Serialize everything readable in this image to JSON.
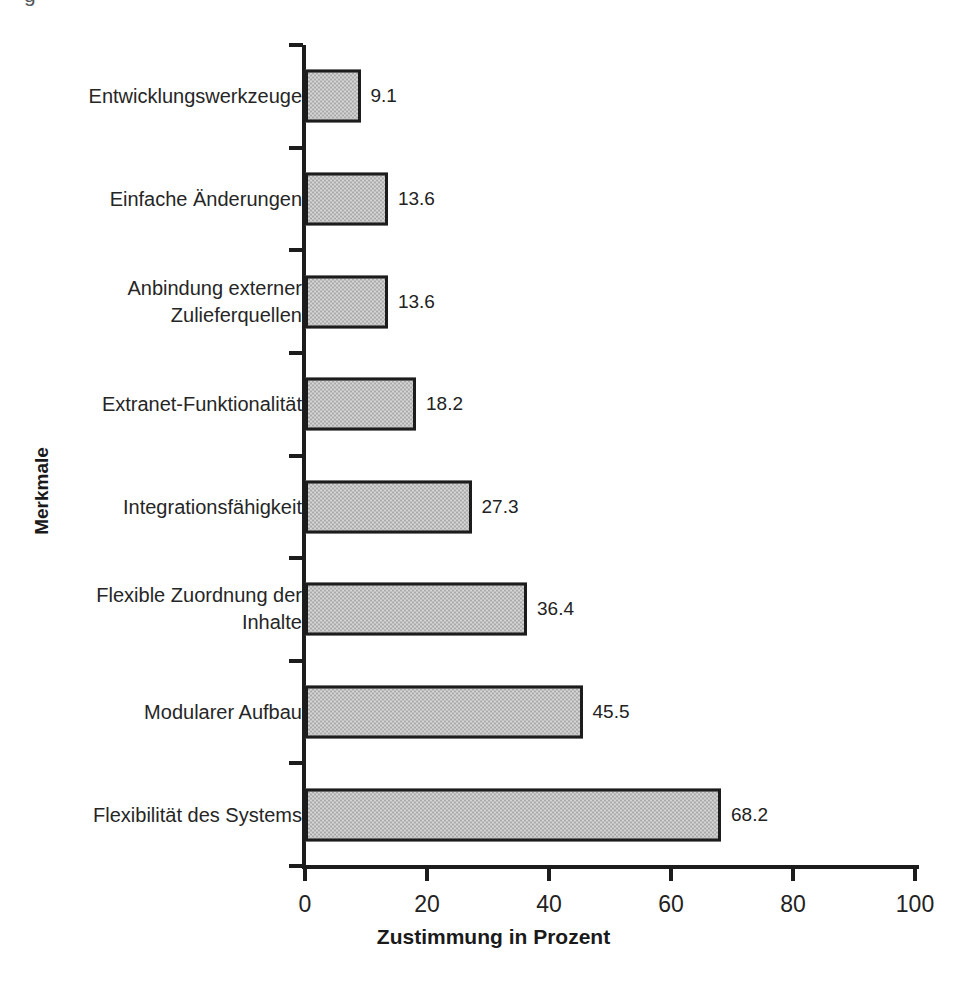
{
  "figure": {
    "caption_remnant": "g",
    "background_color": "#ffffff"
  },
  "chart_data": {
    "type": "bar",
    "orientation": "horizontal",
    "title": "",
    "xlabel": "Zustimmung in Prozent",
    "ylabel": "Merkmale",
    "categories": [
      "Entwicklungswerkzeuge",
      "Einfache Änderungen",
      "Anbindung externer\nZulieferquellen",
      "Extranet-Funktionalität",
      "Integrationsfähigkeit",
      "Flexible Zuordnung der\nInhalte",
      "Modularer Aufbau",
      "Flexibilität des Systems"
    ],
    "values": [
      9.1,
      13.6,
      13.6,
      18.2,
      27.3,
      36.4,
      45.5,
      68.2
    ],
    "value_labels": [
      "9.1",
      "13.6",
      "13.6",
      "18.2",
      "27.3",
      "36.4",
      "45.5",
      "68.2"
    ],
    "xlim": [
      0,
      100
    ],
    "xticks": [
      0,
      20,
      40,
      60,
      80,
      100
    ],
    "xtick_labels": [
      "0",
      "20",
      "40",
      "60",
      "80",
      "100"
    ],
    "grid": false,
    "legend": false,
    "bar_fill_color": "#a9a9a9",
    "bar_edge_color": "#1c1c1c",
    "axis_color": "#1c1c1c",
    "text_color": "#222222"
  }
}
